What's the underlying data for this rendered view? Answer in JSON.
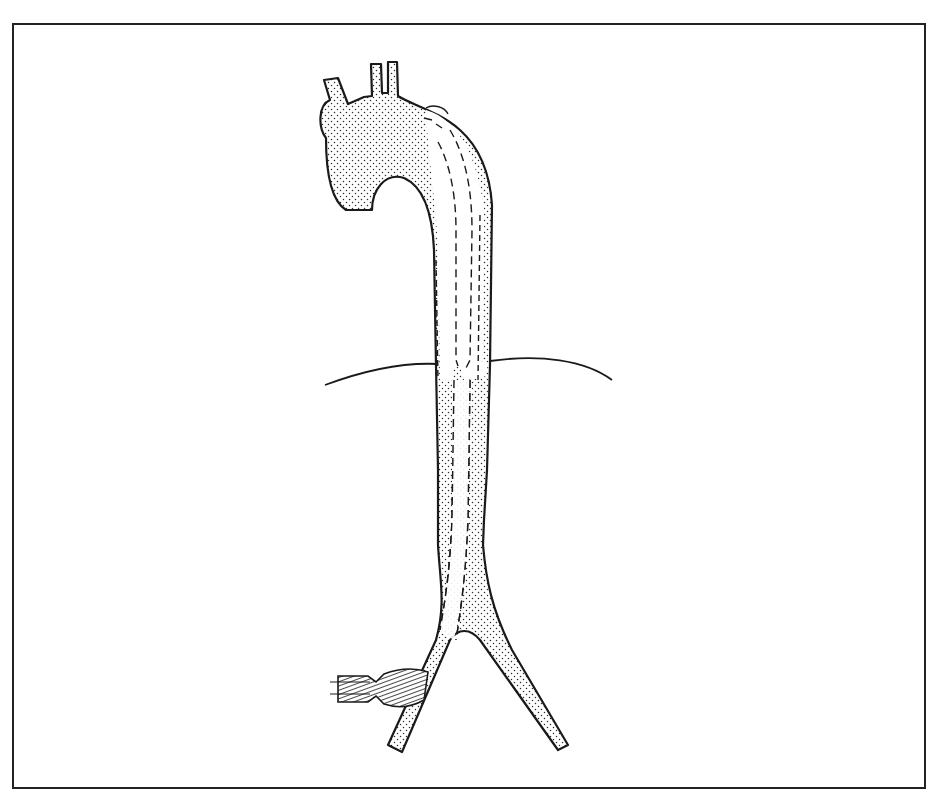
{
  "figure": {
    "type": "medical-line-illustration",
    "labels": [],
    "colors": {
      "background": "#ffffff",
      "ink": "#1a1a1a",
      "stipple": "#2b2b2b",
      "frame": "#222222"
    },
    "parts": [
      "frame-border",
      "aortic-arch",
      "brachiocephalic-branch",
      "left-carotid-branch",
      "left-subclavian-branch",
      "descending-aorta",
      "stent-graft",
      "diaphragm-line",
      "aortic-bifurcation",
      "delivery-sheath"
    ]
  }
}
